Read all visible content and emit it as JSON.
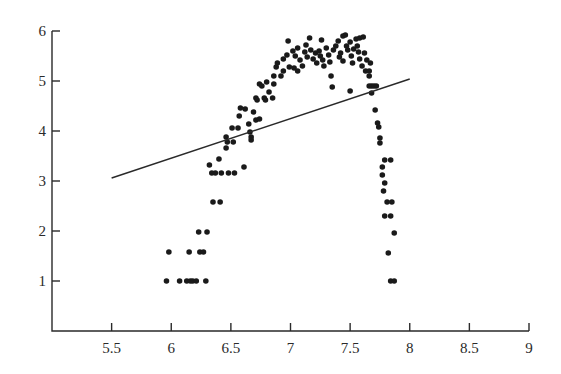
{
  "chart_data": {
    "type": "scatter",
    "title": "",
    "xlabel": "",
    "ylabel": "",
    "xlim": [
      5.0,
      9.0
    ],
    "ylim": [
      0,
      6
    ],
    "grid": false,
    "legend": null,
    "x_ticks": [
      "5.5",
      "6",
      "6.5",
      "7",
      "7.5",
      "8",
      "8.5",
      "9"
    ],
    "x_tick_values": [
      5.5,
      6,
      6.5,
      7,
      7.5,
      8,
      8.5,
      9
    ],
    "y_ticks": [
      "1",
      "2",
      "3",
      "4",
      "5",
      "6"
    ],
    "y_tick_values": [
      1,
      2,
      3,
      4,
      5,
      6
    ],
    "colors": {
      "points": "#1a1a1a",
      "line": "#2a2a2a",
      "axis": "#2a2a2a"
    },
    "series": [
      {
        "name": "observations",
        "kind": "scatter",
        "points": [
          [
            5.96,
            1.0
          ],
          [
            6.07,
            1.0
          ],
          [
            6.13,
            1.0
          ],
          [
            6.16,
            1.0
          ],
          [
            6.18,
            1.0
          ],
          [
            6.21,
            1.0
          ],
          [
            6.29,
            1.0
          ],
          [
            5.98,
            1.58
          ],
          [
            6.15,
            1.58
          ],
          [
            6.24,
            1.58
          ],
          [
            6.27,
            1.58
          ],
          [
            6.23,
            1.98
          ],
          [
            6.3,
            1.98
          ],
          [
            6.35,
            2.58
          ],
          [
            6.41,
            2.58
          ],
          [
            6.34,
            3.16
          ],
          [
            6.37,
            3.16
          ],
          [
            6.42,
            3.16
          ],
          [
            6.48,
            3.16
          ],
          [
            6.53,
            3.16
          ],
          [
            6.32,
            3.32
          ],
          [
            6.61,
            3.28
          ],
          [
            6.4,
            3.44
          ],
          [
            6.46,
            3.66
          ],
          [
            6.47,
            3.78
          ],
          [
            6.52,
            3.78
          ],
          [
            6.46,
            3.88
          ],
          [
            6.51,
            4.06
          ],
          [
            6.56,
            4.06
          ],
          [
            6.65,
            4.14
          ],
          [
            6.66,
            3.98
          ],
          [
            6.67,
            3.88
          ],
          [
            6.67,
            3.82
          ],
          [
            6.57,
            4.3
          ],
          [
            6.62,
            4.44
          ],
          [
            6.69,
            4.38
          ],
          [
            6.58,
            4.46
          ],
          [
            6.71,
            4.22
          ],
          [
            6.74,
            4.24
          ],
          [
            6.71,
            4.66
          ],
          [
            6.79,
            4.62
          ],
          [
            6.78,
            4.66
          ],
          [
            6.72,
            4.62
          ],
          [
            6.85,
            4.66
          ],
          [
            6.82,
            4.78
          ],
          [
            6.74,
            4.94
          ],
          [
            6.76,
            4.9
          ],
          [
            6.86,
            4.94
          ],
          [
            6.8,
            4.98
          ],
          [
            6.86,
            5.1
          ],
          [
            6.88,
            5.28
          ],
          [
            6.92,
            5.1
          ],
          [
            6.94,
            5.2
          ],
          [
            6.89,
            5.36
          ],
          [
            6.94,
            5.44
          ],
          [
            6.97,
            5.52
          ],
          [
            6.99,
            5.28
          ],
          [
            6.98,
            5.8
          ],
          [
            7.02,
            5.6
          ],
          [
            7.04,
            5.5
          ],
          [
            7.06,
            5.66
          ],
          [
            7.08,
            5.42
          ],
          [
            7.03,
            5.26
          ],
          [
            7.06,
            5.2
          ],
          [
            7.1,
            5.3
          ],
          [
            7.12,
            5.58
          ],
          [
            7.14,
            5.48
          ],
          [
            7.13,
            5.72
          ],
          [
            7.16,
            5.86
          ],
          [
            7.17,
            5.62
          ],
          [
            7.19,
            5.44
          ],
          [
            7.21,
            5.56
          ],
          [
            7.22,
            5.36
          ],
          [
            7.24,
            5.6
          ],
          [
            7.25,
            5.5
          ],
          [
            7.27,
            5.42
          ],
          [
            7.28,
            5.3
          ],
          [
            7.26,
            5.82
          ],
          [
            7.3,
            5.66
          ],
          [
            7.32,
            5.52
          ],
          [
            7.33,
            5.38
          ],
          [
            7.34,
            5.1
          ],
          [
            7.35,
            4.88
          ],
          [
            7.36,
            5.62
          ],
          [
            7.38,
            5.7
          ],
          [
            7.4,
            5.8
          ],
          [
            7.41,
            5.48
          ],
          [
            7.42,
            5.56
          ],
          [
            7.44,
            5.4
          ],
          [
            7.44,
            5.9
          ],
          [
            7.46,
            5.92
          ],
          [
            7.47,
            5.7
          ],
          [
            7.48,
            5.62
          ],
          [
            7.5,
            5.78
          ],
          [
            7.51,
            5.5
          ],
          [
            7.52,
            5.36
          ],
          [
            7.53,
            5.64
          ],
          [
            7.5,
            4.8
          ],
          [
            7.55,
            5.84
          ],
          [
            7.56,
            5.7
          ],
          [
            7.57,
            5.58
          ],
          [
            7.58,
            5.44
          ],
          [
            7.6,
            5.3
          ],
          [
            7.62,
            5.56
          ],
          [
            7.63,
            5.2
          ],
          [
            7.58,
            5.86
          ],
          [
            7.61,
            5.88
          ],
          [
            7.64,
            5.42
          ],
          [
            7.66,
            5.2
          ],
          [
            7.67,
            5.36
          ],
          [
            7.66,
            5.1
          ],
          [
            7.68,
            4.9
          ],
          [
            7.7,
            4.9
          ],
          [
            7.66,
            4.9
          ],
          [
            7.72,
            4.9
          ],
          [
            7.68,
            4.76
          ],
          [
            7.71,
            4.42
          ],
          [
            7.73,
            4.16
          ],
          [
            7.74,
            4.08
          ],
          [
            7.75,
            3.86
          ],
          [
            7.75,
            3.76
          ],
          [
            7.79,
            3.42
          ],
          [
            7.84,
            3.42
          ],
          [
            7.77,
            3.28
          ],
          [
            7.77,
            3.12
          ],
          [
            7.79,
            2.96
          ],
          [
            7.78,
            2.8
          ],
          [
            7.81,
            2.58
          ],
          [
            7.85,
            2.58
          ],
          [
            7.79,
            2.3
          ],
          [
            7.84,
            2.3
          ],
          [
            7.87,
            1.96
          ],
          [
            7.82,
            1.56
          ],
          [
            7.84,
            1.0
          ],
          [
            7.87,
            1.0
          ]
        ]
      },
      {
        "name": "linear fit",
        "kind": "line",
        "points": [
          [
            5.5,
            3.06
          ],
          [
            8.0,
            5.04
          ]
        ]
      }
    ]
  }
}
